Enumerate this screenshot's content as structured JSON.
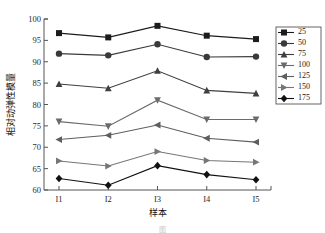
{
  "chart_data": {
    "type": "line",
    "title": "",
    "xlabel": "样本",
    "ylabel": "相对动弹性模量",
    "categories": [
      "I1",
      "I2",
      "I3",
      "I4",
      "I5"
    ],
    "ylim": [
      60,
      100
    ],
    "yticks": [
      60,
      65,
      70,
      75,
      80,
      85,
      90,
      95,
      100
    ],
    "ytick_labels": [
      "60",
      "65",
      "70",
      "75",
      "80",
      "85",
      "90",
      "95",
      "100"
    ],
    "grid": false,
    "legend_position": "right",
    "series": [
      {
        "name": "25",
        "marker": "square",
        "color": "#1c1c1c",
        "values": [
          96.7,
          95.7,
          98.4,
          96.1,
          95.3
        ]
      },
      {
        "name": "50",
        "marker": "circle",
        "color": "#3a3a3a",
        "values": [
          91.9,
          91.5,
          94.1,
          91.1,
          91.2
        ]
      },
      {
        "name": "75",
        "marker": "triangle-up",
        "color": "#3f3f3f",
        "values": [
          84.8,
          83.8,
          87.9,
          83.3,
          82.6
        ]
      },
      {
        "name": "100",
        "marker": "triangle-down",
        "color": "#6b6b6b",
        "values": [
          76.0,
          74.9,
          81.0,
          76.5,
          76.5
        ]
      },
      {
        "name": "125",
        "marker": "triangle-left",
        "color": "#5e5e5e",
        "values": [
          71.8,
          72.8,
          75.2,
          72.1,
          71.2
        ]
      },
      {
        "name": "150",
        "marker": "triangle-right",
        "color": "#767676",
        "values": [
          66.8,
          65.6,
          69.0,
          66.9,
          66.5
        ]
      },
      {
        "name": "175",
        "marker": "diamond",
        "color": "#111111",
        "values": [
          62.7,
          61.1,
          65.7,
          63.6,
          62.4
        ]
      }
    ]
  },
  "legend": {
    "entries": [
      "25",
      "50",
      "75",
      "100",
      "125",
      "150",
      "175"
    ]
  },
  "caption": {
    "text": "图"
  }
}
